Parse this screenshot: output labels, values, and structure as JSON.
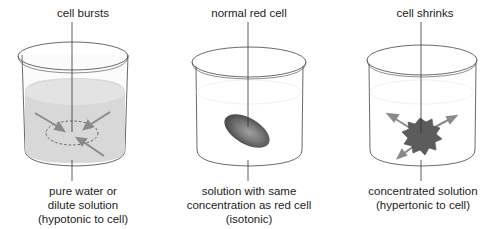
{
  "diagram": {
    "type": "osmosis-red-blood-cell-beakers",
    "colors": {
      "line": "#333333",
      "hypotonic_liquid": "#d6d6d6",
      "arrow": "#8a8a8a",
      "cell_dark": "#555555",
      "cell_light": "#9a9a9a"
    },
    "panels": [
      {
        "id": "hypotonic",
        "top_label": "cell bursts",
        "bottom_lines": [
          "pure water or",
          "dilute solution",
          "(hypotonic to cell)"
        ],
        "arrows_direction": "inward"
      },
      {
        "id": "isotonic",
        "top_label": "normal red cell",
        "bottom_lines": [
          "solution with same",
          "concentration as red cell",
          "(isotonic)"
        ],
        "arrows_direction": "none"
      },
      {
        "id": "hypertonic",
        "top_label": "cell shrinks",
        "bottom_lines": [
          "concentrated solution",
          "(hypertonic to cell)"
        ],
        "arrows_direction": "outward"
      }
    ]
  }
}
